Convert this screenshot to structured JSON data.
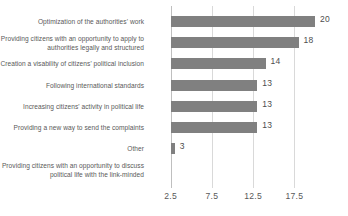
{
  "chart_data": {
    "type": "bar",
    "orientation": "horizontal",
    "title": "",
    "xlabel": "",
    "ylabel": "",
    "categories": [
      "Optimization of the authorities' work",
      "Providing citizens with an opportunity to apply to authorities legally and structured",
      "Creation a visability of citizens' political inclusion",
      "Following international standards",
      "Increasing citizens' activity in political life",
      "Providing a new way to send the complaints",
      "Other",
      "Providing citizens with an opportunity to discuss political life with the link-minded"
    ],
    "values": [
      20,
      18,
      14,
      13,
      13,
      13,
      3,
      null
    ],
    "value_labels": [
      "20",
      "18",
      "14",
      "13",
      "13",
      "13",
      "3",
      ""
    ],
    "xticks": [
      2.5,
      7.5,
      12.5,
      17.5
    ],
    "xtick_labels": [
      "2.5",
      "7.5",
      "12.5",
      "17.5"
    ],
    "xlim": [
      2.5,
      21.5
    ],
    "grid": true,
    "legend": null,
    "bar_color": "#808080",
    "gridline_color": "#d9d9d9",
    "text_color": "#595959"
  }
}
